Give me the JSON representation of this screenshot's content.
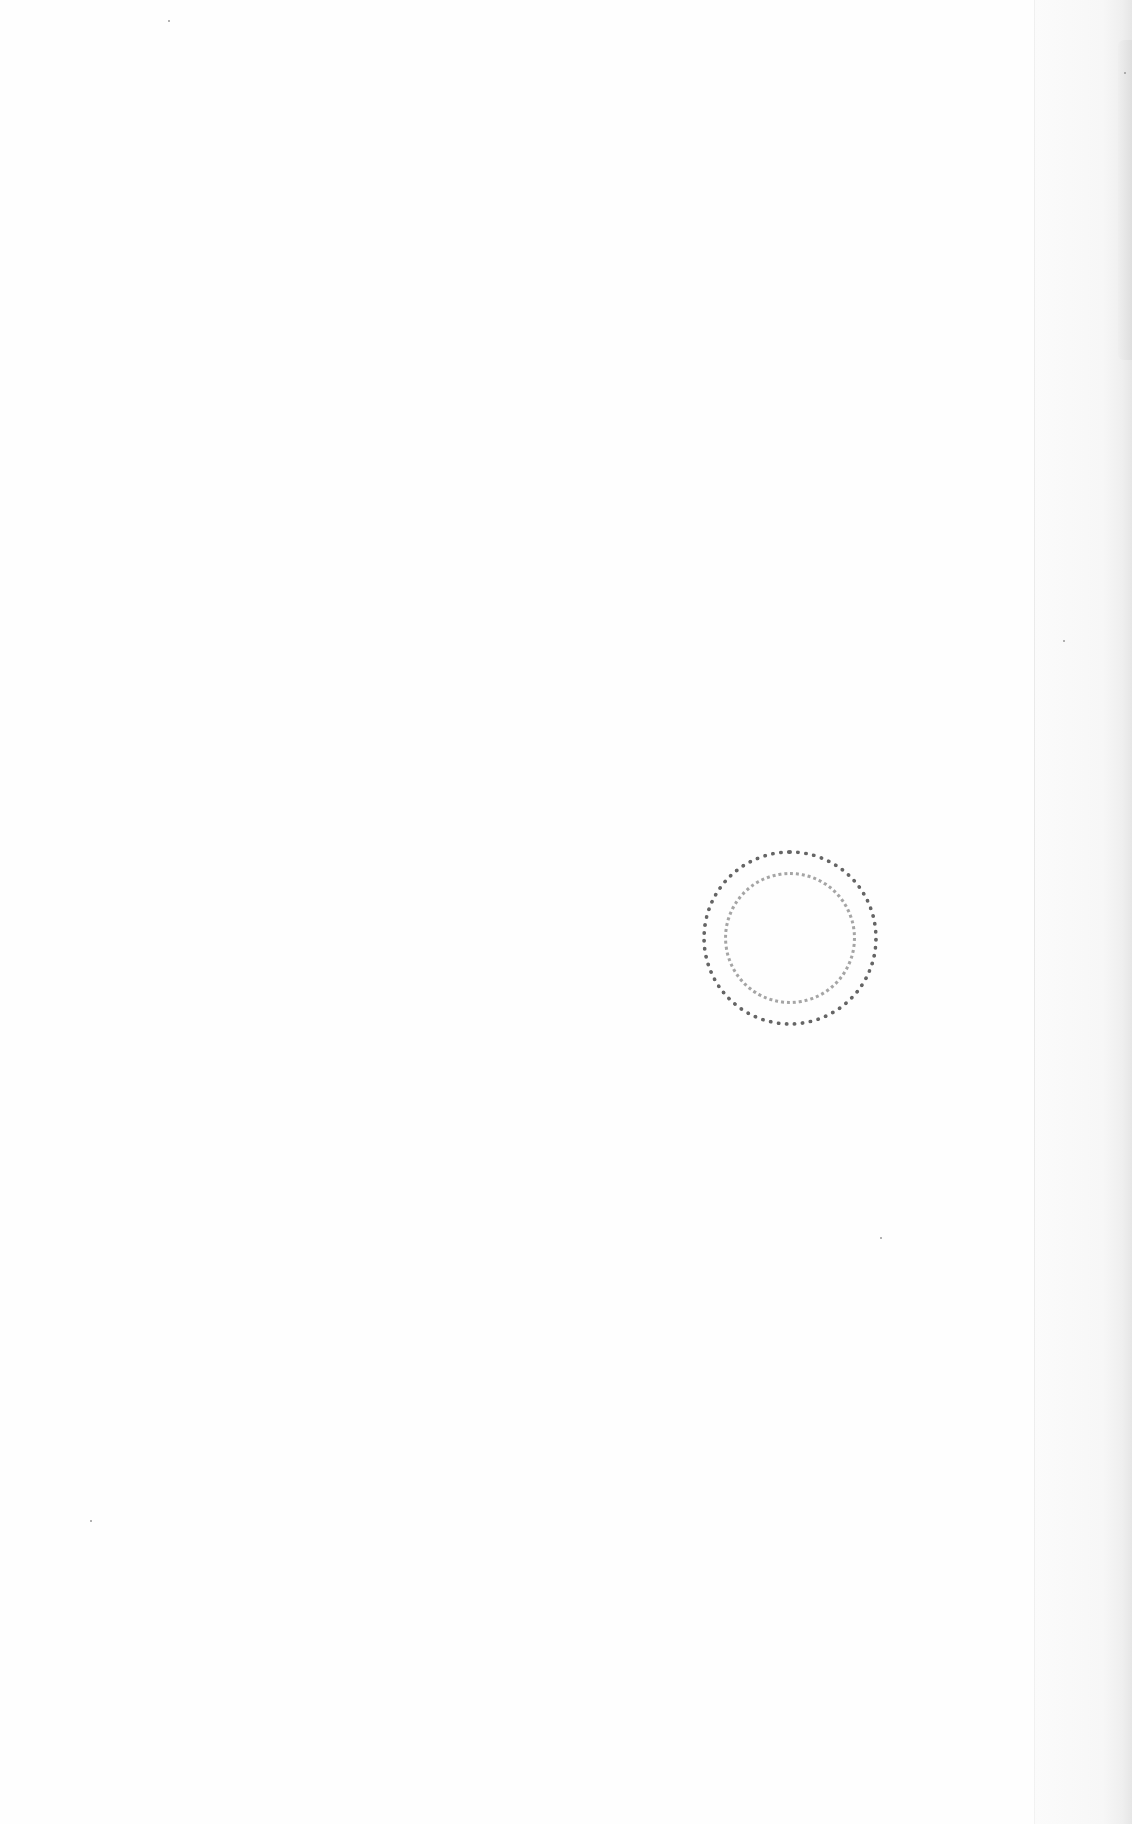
{
  "document": {
    "type": "scanned-blank-page",
    "stamp": {
      "shape": "circular",
      "legible_text": "",
      "color": "#333333"
    },
    "background_color": "#fefefe"
  }
}
